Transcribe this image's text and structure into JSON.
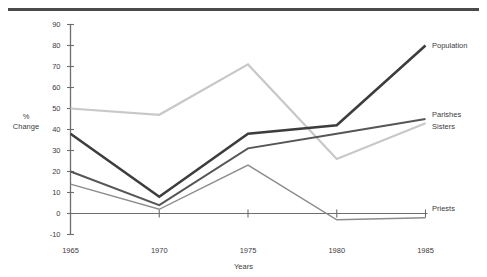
{
  "chart_data": {
    "type": "line",
    "title": "",
    "xlabel": "Years",
    "ylabel": "% Change",
    "x": [
      1965,
      1970,
      1975,
      1980,
      1985
    ],
    "xtick_labels": [
      "1965",
      "1970",
      "1975",
      "1980",
      "1985"
    ],
    "ytick_labels": [
      "-10",
      "0",
      "10",
      "20",
      "30",
      "40",
      "50",
      "60",
      "70",
      "80",
      "90"
    ],
    "ytick_values": [
      -10,
      0,
      10,
      20,
      30,
      40,
      50,
      60,
      70,
      80,
      90
    ],
    "ylim": [
      -10,
      90
    ],
    "xlim": [
      1965,
      1985
    ],
    "grid": false,
    "legend_position": "right-inline-labels",
    "series": [
      {
        "name": "Population",
        "values": [
          38,
          8,
          38,
          42,
          80
        ],
        "color": "#3d3d3d",
        "width": 2.6
      },
      {
        "name": "Parishes",
        "values": [
          20,
          4,
          31,
          38,
          45
        ],
        "color": "#565656",
        "width": 1.9
      },
      {
        "name": "Sisters",
        "values": [
          50,
          47,
          71,
          26,
          43
        ],
        "color": "#c8c8c8",
        "width": 2.2
      },
      {
        "name": "Priests",
        "values": [
          14,
          2,
          23,
          -3,
          -2
        ],
        "color": "#8c8c8c",
        "width": 1.5
      }
    ],
    "annotations": [
      {
        "text": "Population",
        "series": "Population"
      },
      {
        "text": "Parishes",
        "series": "Parishes"
      },
      {
        "text": "Sisters",
        "series": "Sisters"
      },
      {
        "text": "Priests",
        "series": "Priests"
      }
    ]
  },
  "axes": {
    "y_title_line1": "%",
    "y_title_line2": "Change",
    "x_title": "Years"
  }
}
